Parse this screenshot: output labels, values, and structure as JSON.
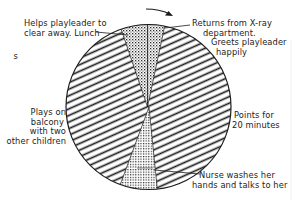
{
  "diagram": {
    "type": "activity-pie-chart",
    "direction_arrow": "clockwise-arrow",
    "colors": {
      "ink": "#1d1d1d",
      "background": "#ffffff"
    },
    "segments": [
      {
        "name": "returns-from-xray",
        "pattern": "dotted",
        "label": "Returns from X-ray department. Greets playleader happily"
      },
      {
        "name": "paints",
        "pattern": "diagonal-hatch",
        "label": "Paints for 20 minutes"
      },
      {
        "name": "nurse-washes-hands",
        "pattern": "cross-dotted",
        "label": "Nurse washes her hands and talks to her"
      },
      {
        "name": "plays-on-balcony",
        "pattern": "diagonal-hatch",
        "label": "Plays on balcony with two other children"
      },
      {
        "name": "helps-playleader",
        "pattern": "dotted",
        "label": "Helps playleader to clear away. Lunch"
      }
    ],
    "labels": {
      "helps_line1": "Helps playleader to",
      "helps_line2": "clear away. Lunch",
      "returns_line1": "Returns from X-ray",
      "returns_line2": "department.",
      "returns_line3": "Greets playleader",
      "returns_line4": "happily",
      "plays_line1": "Plays on",
      "plays_line2": "balcony",
      "plays_line3": "with two",
      "plays_line4": "other children",
      "paints_line1": "Points for",
      "paints_line2": "20 minutes",
      "nurse_line1": "Nurse washes her",
      "nurse_line2": "hands and talks to her",
      "edge_fragment": "s"
    }
  }
}
